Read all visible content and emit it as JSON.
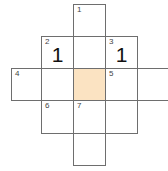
{
  "puzzle": {
    "highlight_color": "#fbe3c2",
    "cells": [
      {
        "id": "r0c2",
        "row": 0,
        "col": 2,
        "number": "1",
        "value": "",
        "highlighted": false
      },
      {
        "id": "r1c1",
        "row": 1,
        "col": 1,
        "number": "2",
        "value": "1",
        "highlighted": false
      },
      {
        "id": "r1c2",
        "row": 1,
        "col": 2,
        "number": "",
        "value": "",
        "highlighted": false
      },
      {
        "id": "r1c3",
        "row": 1,
        "col": 3,
        "number": "3",
        "value": "1",
        "highlighted": false
      },
      {
        "id": "r2c0",
        "row": 2,
        "col": 0,
        "number": "4",
        "value": "",
        "highlighted": false
      },
      {
        "id": "r2c1",
        "row": 2,
        "col": 1,
        "number": "",
        "value": "",
        "highlighted": false
      },
      {
        "id": "r2c2",
        "row": 2,
        "col": 2,
        "number": "",
        "value": "",
        "highlighted": true
      },
      {
        "id": "r2c3",
        "row": 2,
        "col": 3,
        "number": "5",
        "value": "",
        "highlighted": false
      },
      {
        "id": "r2c4",
        "row": 2,
        "col": 4,
        "number": "",
        "value": "",
        "highlighted": false
      },
      {
        "id": "r3c1",
        "row": 3,
        "col": 1,
        "number": "6",
        "value": "",
        "highlighted": false
      },
      {
        "id": "r3c2",
        "row": 3,
        "col": 2,
        "number": "7",
        "value": "",
        "highlighted": false
      },
      {
        "id": "r3c3",
        "row": 3,
        "col": 3,
        "number": "",
        "value": "",
        "highlighted": false
      },
      {
        "id": "r4c2",
        "row": 4,
        "col": 2,
        "number": "",
        "value": "",
        "highlighted": false
      }
    ]
  }
}
